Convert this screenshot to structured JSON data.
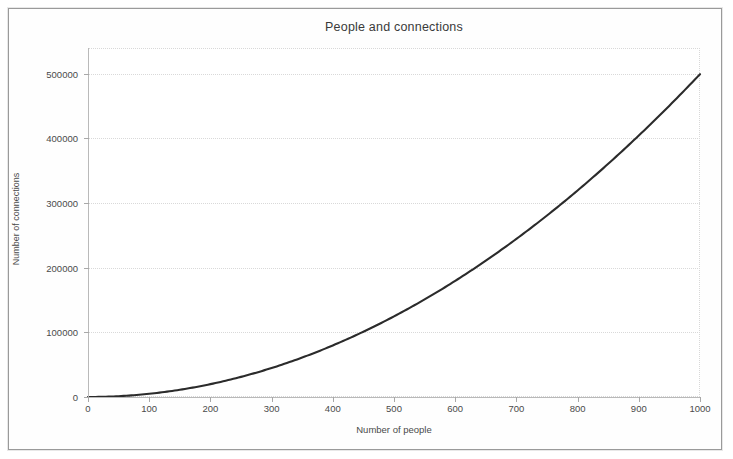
{
  "figure": {
    "title": "People and connections",
    "frame_color": "#9a9a9a",
    "background": "#ffffff",
    "line_color": "#2b2b2b",
    "grid_color": "#d9d9d9",
    "axis_color": "#b9b9b9"
  },
  "chart_data": {
    "type": "line",
    "title": "People and connections",
    "xlabel": "Number of people",
    "ylabel": "Number of connections",
    "xlim": [
      0,
      1000
    ],
    "ylim": [
      0,
      540000
    ],
    "grid": true,
    "legend": "none",
    "xticks": [
      0,
      100,
      200,
      300,
      400,
      500,
      600,
      700,
      800,
      900,
      1000
    ],
    "xtick_labels": [
      "0",
      "100",
      "200",
      "300",
      "400",
      "500",
      "600",
      "700",
      "800",
      "900",
      "1000"
    ],
    "yticks": [
      0,
      100000,
      200000,
      300000,
      400000,
      500000
    ],
    "ytick_labels": [
      "0",
      "100000",
      "200000",
      "300000",
      "400000",
      "500000"
    ],
    "series": [
      {
        "name": "connections",
        "formula": "n*(n-1)/2",
        "x": [
          0,
          50,
          100,
          150,
          200,
          250,
          300,
          350,
          400,
          450,
          500,
          550,
          600,
          650,
          700,
          750,
          800,
          850,
          900,
          950,
          1000
        ],
        "values": [
          0,
          1225,
          4950,
          11175,
          19900,
          31125,
          44850,
          61075,
          79800,
          101025,
          124750,
          150975,
          179700,
          210925,
          244650,
          280875,
          319600,
          360825,
          404550,
          450775,
          499500
        ]
      }
    ]
  }
}
